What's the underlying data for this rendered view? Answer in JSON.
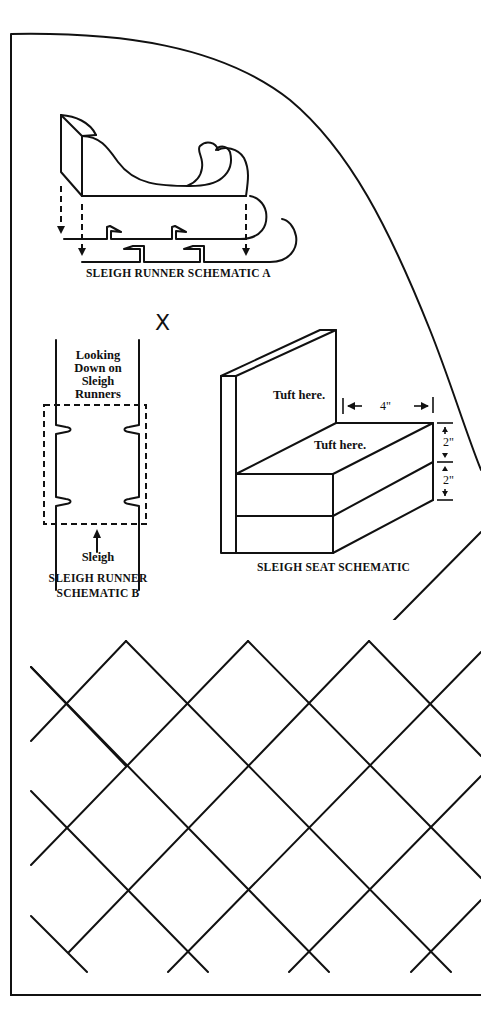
{
  "page": {
    "type": "pattern-sheet",
    "background": "#ffffff",
    "ink": "#111111"
  },
  "schematic_a": {
    "caption": "SLEIGH RUNNER SCHEMATIC A"
  },
  "schematic_b": {
    "note_lines": [
      "Looking",
      "Down on",
      "Sleigh",
      "Runners"
    ],
    "arrow_label": "Sleigh",
    "caption_line1": "SLEIGH RUNNER",
    "caption_line2": "SCHEMATIC B",
    "mark": "X"
  },
  "seat": {
    "back_note": "Tuft here.",
    "seat_note": "Tuft here.",
    "width_dim": "4\"",
    "height_dim_top": "2\"",
    "height_dim_bottom": "2\"",
    "caption": "SLEIGH SEAT SCHEMATIC"
  },
  "quilting": {
    "pattern": "diagonal-lattice"
  }
}
